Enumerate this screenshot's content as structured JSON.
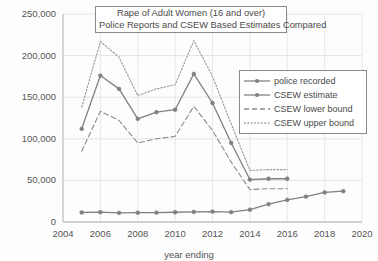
{
  "chart_data": {
    "type": "line",
    "title": "Rape of Adult Women (16 and over)",
    "subtitle": "Police Reports and CSEW Based Estimates Compared",
    "xlabel": "year ending",
    "ylabel": "",
    "xlim": [
      2004,
      2020
    ],
    "ylim": [
      0,
      250000
    ],
    "xticks": [
      2004,
      2006,
      2008,
      2010,
      2012,
      2014,
      2016,
      2018,
      2020
    ],
    "yticks": [
      0,
      50000,
      100000,
      150000,
      200000,
      250000
    ],
    "ytick_labels": [
      "0",
      "50,000",
      "100,000",
      "150,000",
      "200,000",
      "250,000"
    ],
    "grid": true,
    "legend_position": "right",
    "series": [
      {
        "name": "police recorded",
        "style": "solid-markers",
        "color": "#808080",
        "x": [
          2005,
          2006,
          2007,
          2008,
          2009,
          2010,
          2011,
          2012,
          2013,
          2014,
          2015,
          2016,
          2017,
          2018,
          2019
        ],
        "values": [
          11500,
          11800,
          11000,
          11200,
          11300,
          11700,
          12100,
          12500,
          11900,
          14800,
          21500,
          26500,
          30500,
          35500,
          37000
        ]
      },
      {
        "name": "CSEW estimate",
        "style": "solid-markers",
        "color": "#808080",
        "x": [
          2005,
          2006,
          2007,
          2008,
          2009,
          2010,
          2011,
          2012,
          2013,
          2014,
          2015,
          2016
        ],
        "values": [
          112000,
          176000,
          160000,
          124000,
          132000,
          135000,
          178000,
          143000,
          95000,
          51000,
          52000,
          52000
        ]
      },
      {
        "name": "CSEW lower bound",
        "style": "dashed",
        "color": "#8a8a8a",
        "x": [
          2005,
          2006,
          2007,
          2008,
          2009,
          2010,
          2011,
          2012,
          2013,
          2014,
          2015,
          2016
        ],
        "values": [
          85000,
          133000,
          122000,
          95000,
          100000,
          103000,
          139000,
          110000,
          72000,
          39000,
          40000,
          40000
        ]
      },
      {
        "name": "CSEW upper bound",
        "style": "dotted",
        "color": "#999999",
        "x": [
          2005,
          2006,
          2007,
          2008,
          2009,
          2010,
          2011,
          2012,
          2013,
          2014,
          2015,
          2016
        ],
        "values": [
          138000,
          217000,
          198000,
          152000,
          160000,
          165000,
          218000,
          175000,
          118000,
          62000,
          63000,
          63000
        ]
      }
    ]
  }
}
